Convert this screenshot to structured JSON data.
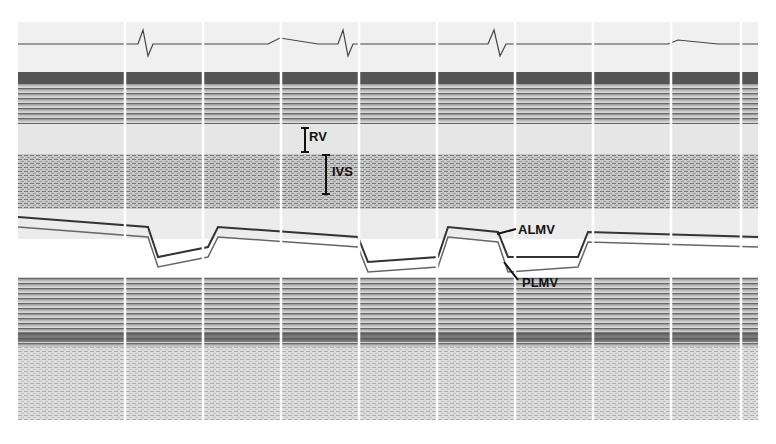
{
  "figure": {
    "type": "M-mode echocardiogram",
    "labels": {
      "rv": "RV",
      "ivs": "IVS",
      "almv": "ALMV",
      "plmv": "PLMV"
    }
  }
}
